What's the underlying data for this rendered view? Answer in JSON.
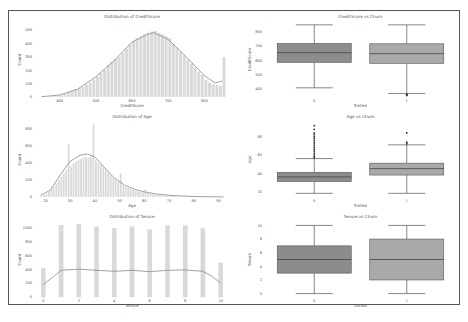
{
  "figure": {
    "frame_color": "#555555",
    "bar_color": "#d9d9d9",
    "kde_color": "#8a8a8a",
    "box0_color": "#8c8c8c",
    "box1_color": "#a9a9a9"
  },
  "chart_data": [
    {
      "id": "credit_hist",
      "type": "bar",
      "title": "Distribution of CreditScore",
      "xlabel": "CreditScore",
      "ylabel": "Count",
      "xlim": [
        340,
        860
      ],
      "ylim": [
        0,
        560
      ],
      "xticks": [
        400,
        500,
        600,
        700,
        800
      ],
      "yticks": [
        0,
        100,
        200,
        300,
        400,
        500
      ],
      "bin_width": 10,
      "bins_x": [
        350,
        360,
        370,
        380,
        390,
        400,
        410,
        420,
        430,
        440,
        450,
        460,
        470,
        480,
        490,
        500,
        510,
        520,
        530,
        540,
        550,
        560,
        570,
        580,
        590,
        600,
        610,
        620,
        630,
        640,
        650,
        660,
        670,
        680,
        690,
        700,
        710,
        720,
        730,
        740,
        750,
        760,
        770,
        780,
        790,
        800,
        810,
        820,
        830,
        840,
        850
      ],
      "values": [
        2,
        3,
        5,
        8,
        10,
        15,
        25,
        35,
        45,
        55,
        65,
        75,
        95,
        110,
        130,
        155,
        180,
        205,
        240,
        265,
        285,
        300,
        330,
        360,
        390,
        420,
        440,
        455,
        470,
        480,
        490,
        495,
        480,
        470,
        455,
        440,
        400,
        370,
        340,
        310,
        280,
        250,
        220,
        190,
        165,
        130,
        110,
        95,
        90,
        85,
        300
      ],
      "kde": [
        [
          350,
          2
        ],
        [
          400,
          15
        ],
        [
          450,
          60
        ],
        [
          500,
          150
        ],
        [
          550,
          270
        ],
        [
          600,
          410
        ],
        [
          640,
          465
        ],
        [
          660,
          480
        ],
        [
          700,
          430
        ],
        [
          750,
          300
        ],
        [
          800,
          160
        ],
        [
          830,
          105
        ],
        [
          850,
          120
        ]
      ]
    },
    {
      "id": "age_hist",
      "type": "bar",
      "title": "Distribution of Age",
      "xlabel": "Age",
      "ylabel": "Count",
      "xlim": [
        17,
        93
      ],
      "ylim": [
        0,
        880
      ],
      "xticks": [
        20,
        30,
        40,
        50,
        60,
        70,
        80,
        90
      ],
      "yticks": [
        0,
        200,
        400,
        600,
        800
      ],
      "bin_width": 1,
      "bins_x": [
        18,
        19,
        20,
        21,
        22,
        23,
        24,
        25,
        26,
        27,
        28,
        29,
        30,
        31,
        32,
        33,
        34,
        35,
        36,
        37,
        38,
        39,
        40,
        41,
        42,
        43,
        44,
        45,
        46,
        47,
        48,
        49,
        50,
        51,
        52,
        53,
        54,
        55,
        56,
        57,
        58,
        59,
        60,
        61,
        62,
        63,
        64,
        65,
        66,
        67,
        68,
        69,
        70,
        71,
        72,
        73,
        74,
        75,
        76,
        77,
        78,
        79,
        80,
        81,
        82,
        83,
        84,
        85,
        86,
        87,
        88,
        89,
        90,
        91,
        92
      ],
      "values": [
        20,
        25,
        40,
        60,
        90,
        120,
        160,
        200,
        240,
        280,
        320,
        620,
        360,
        400,
        420,
        440,
        450,
        460,
        470,
        460,
        480,
        850,
        430,
        400,
        380,
        350,
        320,
        290,
        260,
        230,
        200,
        180,
        280,
        140,
        120,
        110,
        100,
        90,
        80,
        70,
        60,
        55,
        90,
        45,
        40,
        35,
        30,
        28,
        25,
        22,
        20,
        18,
        16,
        14,
        12,
        10,
        9,
        8,
        7,
        6,
        5,
        4,
        3,
        3,
        2,
        2,
        2,
        1,
        1,
        1,
        1,
        1,
        1,
        1,
        1
      ],
      "kde": [
        [
          18,
          20
        ],
        [
          22,
          80
        ],
        [
          26,
          260
        ],
        [
          30,
          420
        ],
        [
          34,
          490
        ],
        [
          37,
          505
        ],
        [
          40,
          470
        ],
        [
          44,
          340
        ],
        [
          48,
          220
        ],
        [
          52,
          140
        ],
        [
          56,
          90
        ],
        [
          60,
          60
        ],
        [
          65,
          35
        ],
        [
          70,
          20
        ],
        [
          80,
          6
        ],
        [
          92,
          1
        ]
      ]
    },
    {
      "id": "tenure_hist",
      "type": "bar",
      "title": "Distribution of Tenure",
      "xlabel": "Tenure",
      "ylabel": "Count",
      "xlim": [
        -0.3,
        10.3
      ],
      "ylim": [
        0,
        1080
      ],
      "xticks": [
        0,
        2,
        4,
        6,
        8,
        10
      ],
      "yticks": [
        0,
        200,
        400,
        600,
        800,
        1000
      ],
      "categories": [
        0,
        1,
        2,
        3,
        4,
        5,
        6,
        7,
        8,
        9,
        10
      ],
      "values": [
        413,
        1035,
        1048,
        1009,
        989,
        1012,
        967,
        1028,
        1025,
        984,
        490
      ],
      "kde": [
        [
          0,
          180
        ],
        [
          0.5,
          280
        ],
        [
          1,
          385
        ],
        [
          2,
          400
        ],
        [
          3,
          385
        ],
        [
          4,
          370
        ],
        [
          5,
          385
        ],
        [
          6,
          365
        ],
        [
          7,
          385
        ],
        [
          8,
          390
        ],
        [
          9,
          370
        ],
        [
          9.5,
          300
        ],
        [
          10,
          200
        ]
      ]
    },
    {
      "id": "credit_box",
      "type": "box",
      "title": "CreditScore vs Churn",
      "xlabel": "Exited",
      "ylabel": "CreditScore",
      "categories": [
        "0",
        "1"
      ],
      "ylim": [
        340,
        870
      ],
      "yticks": [
        400,
        500,
        600,
        700,
        800
      ],
      "boxes": [
        {
          "label": "0",
          "whislo": 405,
          "q1": 585,
          "med": 653,
          "q3": 718,
          "whishi": 850,
          "outliers": []
        },
        {
          "label": "1",
          "whislo": 365,
          "q1": 578,
          "med": 646,
          "q3": 716,
          "whishi": 850,
          "outliers": [
            350,
            355,
            358,
            360
          ]
        }
      ]
    },
    {
      "id": "age_box",
      "type": "box",
      "title": "Age vs Churn",
      "xlabel": "Exited",
      "ylabel": "Age",
      "categories": [
        "0",
        "1"
      ],
      "ylim": [
        14,
        96
      ],
      "yticks": [
        20,
        40,
        60,
        80
      ],
      "boxes": [
        {
          "label": "0",
          "whislo": 18,
          "q1": 31,
          "med": 36,
          "q3": 41,
          "whishi": 56,
          "outliers": [
            57,
            58,
            60,
            62,
            64,
            66,
            68,
            70,
            72,
            74,
            76,
            78,
            80,
            82,
            84,
            88,
            92
          ]
        },
        {
          "label": "1",
          "whislo": 18,
          "q1": 38,
          "med": 45,
          "q3": 51,
          "whishi": 71,
          "outliers": [
            72,
            73,
            74,
            84
          ]
        }
      ]
    },
    {
      "id": "tenure_box",
      "type": "box",
      "title": "Tenure vs Churn",
      "xlabel": "Exited",
      "ylabel": "Tenure",
      "categories": [
        "0",
        "1"
      ],
      "ylim": [
        -0.5,
        10.5
      ],
      "yticks": [
        0,
        2,
        4,
        6,
        8,
        10
      ],
      "boxes": [
        {
          "label": "0",
          "whislo": 0,
          "q1": 3,
          "med": 5,
          "q3": 7,
          "whishi": 10,
          "outliers": []
        },
        {
          "label": "1",
          "whislo": 0,
          "q1": 2,
          "med": 5,
          "q3": 8,
          "whishi": 10,
          "outliers": []
        }
      ]
    }
  ]
}
